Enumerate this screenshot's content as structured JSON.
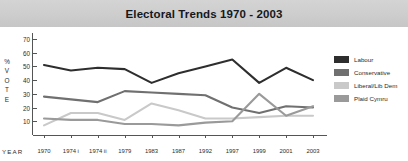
{
  "banner": {
    "title": "Electoral Trends 1970 - 2003"
  },
  "axes": {
    "y_label_chars": [
      "%",
      "V",
      "O",
      "T",
      "E"
    ],
    "y_label_text": "% VOTE",
    "x_label": "YEAR",
    "y_ticks": [
      70,
      60,
      50,
      40,
      30,
      20,
      10
    ],
    "x_ticks": [
      "1970",
      "1974 i",
      "1974 ii",
      "1979",
      "1983",
      "1987",
      "1992",
      "1997",
      "1999",
      "2001",
      "2003"
    ]
  },
  "legend": {
    "position": "right",
    "items": [
      {
        "label": "Labour",
        "color": "#2e2e2e"
      },
      {
        "label": "Conservative",
        "color": "#707070"
      },
      {
        "label": "Liberal/Lib Dem",
        "color": "#c9c9c9"
      },
      {
        "label": "Plaid Cymru",
        "color": "#9a9a9a"
      }
    ]
  },
  "chart_data": {
    "type": "line",
    "title": "Electoral Trends 1970 - 2003",
    "xlabel": "YEAR",
    "ylabel": "% VOTE",
    "ylim": [
      0,
      70
    ],
    "grid": false,
    "legend_position": "right",
    "categories": [
      "1970",
      "1974 i",
      "1974 ii",
      "1979",
      "1983",
      "1987",
      "1992",
      "1997",
      "1999",
      "2001",
      "2003"
    ],
    "series": [
      {
        "name": "Labour",
        "color": "#2e2e2e",
        "values": [
          51,
          47,
          49,
          48,
          38,
          45,
          50,
          55,
          38,
          49,
          40
        ]
      },
      {
        "name": "Conservative",
        "color": "#707070",
        "values": [
          28,
          26,
          24,
          32,
          31,
          30,
          29,
          20,
          16,
          21,
          20
        ]
      },
      {
        "name": "Liberal/Lib Dem",
        "color": "#c9c9c9",
        "values": [
          7,
          16,
          16,
          11,
          23,
          18,
          12,
          12,
          13,
          14,
          14
        ]
      },
      {
        "name": "Plaid Cymru",
        "color": "#9a9a9a",
        "values": [
          12,
          11,
          11,
          8,
          8,
          7,
          9,
          10,
          30,
          14,
          21
        ]
      }
    ]
  }
}
